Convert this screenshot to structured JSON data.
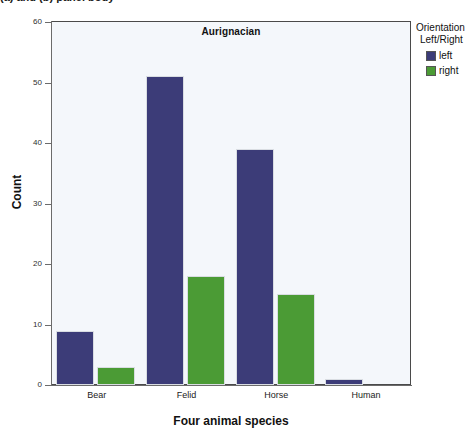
{
  "caption_fragment": "(a) and (b) panel body",
  "chart_data": {
    "type": "bar",
    "title": "Aurignacian",
    "xlabel": "Four animal species",
    "ylabel": "Count",
    "categories": [
      "Bear",
      "Felid",
      "Horse",
      "Human"
    ],
    "series": [
      {
        "name": "left",
        "color": "#3c3c78",
        "values": [
          9,
          51,
          39,
          1
        ]
      },
      {
        "name": "right",
        "color": "#4b9b35",
        "values": [
          3,
          18,
          15,
          0
        ]
      }
    ],
    "ylim": [
      0,
      60
    ],
    "yticks": [
      0,
      10,
      20,
      30,
      40,
      50,
      60
    ],
    "grid": false,
    "legend_position": "right"
  },
  "legend": {
    "title_line1": "Orientation",
    "title_line2": "Left/Right",
    "entries": [
      {
        "label": "left",
        "color": "#3c3c78"
      },
      {
        "label": "right",
        "color": "#4b9b35"
      }
    ]
  }
}
